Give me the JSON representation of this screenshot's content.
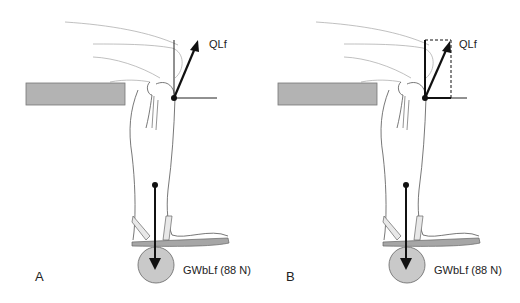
{
  "figure": {
    "panels": [
      {
        "id": "A",
        "letter": "A",
        "force_upper_label": "QLf",
        "force_lower_label": "GWbLf (88 N)",
        "resolution": "single resultant vector"
      },
      {
        "id": "B",
        "letter": "B",
        "force_upper_label": "QLf",
        "force_lower_label": "GWbLf (88 N)",
        "resolution": "vector resolved into vertical and horizontal components (dashed parallelogram)"
      }
    ],
    "colors": {
      "outline": "#a8a8a8",
      "leg_outline": "#555555",
      "vector": "#111111",
      "table_fill": "#b3b3b3",
      "table_stroke": "#777777",
      "weight_fill": "#c9c9c9",
      "sole_fill": "#a6a6a6"
    }
  }
}
